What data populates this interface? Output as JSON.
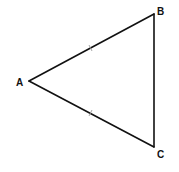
{
  "diagram": {
    "type": "geometry-triangle",
    "vertices": [
      {
        "id": "A",
        "label": "A",
        "x": 29,
        "y": 81,
        "label_x": 16,
        "label_y": 86
      },
      {
        "id": "B",
        "label": "B",
        "x": 154,
        "y": 14,
        "label_x": 157,
        "label_y": 15
      },
      {
        "id": "C",
        "label": "C",
        "x": 154,
        "y": 147,
        "label_x": 157,
        "label_y": 158
      }
    ],
    "sides": [
      {
        "from": "A",
        "to": "B",
        "tick_marks": 1
      },
      {
        "from": "A",
        "to": "C",
        "tick_marks": 1
      },
      {
        "from": "B",
        "to": "C",
        "tick_marks": 0
      }
    ],
    "colors": {
      "line": "#111111",
      "tick": "#9a9a9a",
      "background": "#ffffff"
    }
  }
}
